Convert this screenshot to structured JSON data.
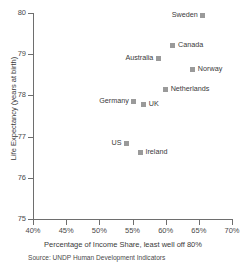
{
  "chart_data": {
    "type": "scatter",
    "title": "",
    "xlabel": "Percentage of Income Share, least well off 80%",
    "ylabel": "Life Expectancy (years at birth)",
    "source": "Source: UNDP Human Development Indicators",
    "xlim": [
      40,
      70
    ],
    "ylim": [
      75,
      80
    ],
    "xticks": [
      40,
      45,
      50,
      55,
      60,
      65,
      70
    ],
    "xtick_labels": [
      "40%",
      "45%",
      "50%",
      "55%",
      "60%",
      "65%",
      "70%"
    ],
    "yticks": [
      75,
      76,
      77,
      78,
      79,
      80
    ],
    "ytick_labels": [
      "75",
      "76",
      "77",
      "78",
      "79",
      "80"
    ],
    "grid": false,
    "legend": "none",
    "marker_color": "#9a9a9a",
    "axis_color": "#6e6e6e",
    "points": [
      {
        "label": "Sweden",
        "x": 65.6,
        "y": 79.95,
        "label_side": "left"
      },
      {
        "label": "Canada",
        "x": 61.1,
        "y": 79.2,
        "label_side": "right"
      },
      {
        "label": "Australia",
        "x": 58.9,
        "y": 78.9,
        "label_side": "left"
      },
      {
        "label": "Norway",
        "x": 64.1,
        "y": 78.62,
        "label_side": "right"
      },
      {
        "label": "Netherlands",
        "x": 60.0,
        "y": 78.15,
        "label_side": "right"
      },
      {
        "label": "Germany",
        "x": 55.2,
        "y": 77.84,
        "label_side": "left"
      },
      {
        "label": "UK",
        "x": 56.7,
        "y": 77.77,
        "label_side": "right"
      },
      {
        "label": "US",
        "x": 54.1,
        "y": 76.84,
        "label_side": "left"
      },
      {
        "label": "Ireland",
        "x": 56.2,
        "y": 76.62,
        "label_side": "right"
      }
    ]
  }
}
